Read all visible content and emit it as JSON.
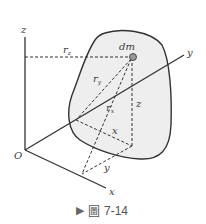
{
  "figure": {
    "caption_prefix": "圖",
    "caption_number": "7-14",
    "labels": {
      "z_axis": "z",
      "y_axis": "y",
      "x_axis": "x",
      "origin": "O",
      "mass_element": "dm",
      "r_z": "r",
      "r_z_sub": "z",
      "r_y": "r",
      "r_y_sub": "y",
      "r_x": "r",
      "r_x_sub": "x",
      "z_coord": "z",
      "x_coord": "x",
      "y_coord": "y"
    },
    "colors": {
      "body_fill": "#eeeeee",
      "line": "#333333",
      "dm": "#888888"
    }
  }
}
